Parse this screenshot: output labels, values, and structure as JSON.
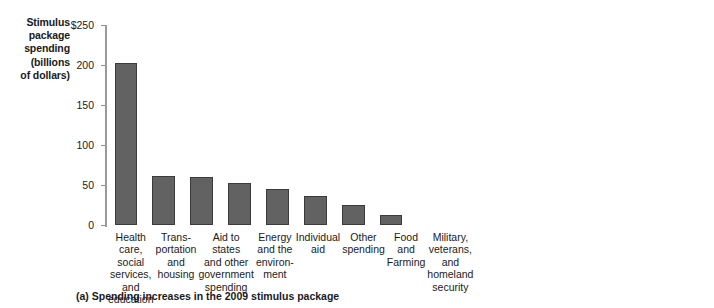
{
  "chart_data": [
    {
      "type": "bar",
      "panel": "a",
      "title": "Stimulus package spending (billions of dollars)",
      "title_lines": [
        "Stimulus",
        "package",
        "spending",
        "(billions",
        "of dollars)"
      ],
      "caption": "(a) Spending increases in the 2009 stimulus package",
      "xlabel": "",
      "ylabel": "Stimulus package spending (billions of dollars)",
      "ylim": [
        0,
        250
      ],
      "yticks": [
        0,
        50,
        100,
        150,
        200,
        250
      ],
      "ytick_labels": [
        "0",
        "50",
        "100",
        "150",
        "200",
        "$250"
      ],
      "grid": false,
      "legend": "none",
      "bar_color": "#626262",
      "categories": [
        "Health care, social services, and education",
        "Transportation and housing",
        "Aid to states and other government spending",
        "Energy and the environment",
        "Individual aid",
        "Other spending",
        "Food and Farming",
        "Military, veterans, and homeland security"
      ],
      "category_lines": [
        [
          "Health care,",
          "social services,",
          "and education"
        ],
        [
          "Trans-",
          "portation",
          "and",
          "housing"
        ],
        [
          "Aid to states",
          "and other",
          "government",
          "spending"
        ],
        [
          "Energy",
          "and the",
          "environ-",
          "ment"
        ],
        [
          "Individual",
          "aid"
        ],
        [
          "Other",
          "spending"
        ],
        [
          "Food",
          "and",
          "Farming"
        ],
        [
          "Military,",
          "veterans,",
          "and",
          "homeland",
          "security"
        ]
      ],
      "values": [
        203,
        61,
        60,
        52,
        45,
        36,
        25,
        12
      ]
    },
    {
      "type": "bar",
      "panel": "b",
      "title": "Tax Cuts (billions of dollars)",
      "title_lines": [
        "Tax Cuts",
        "(billions",
        "of dollars)"
      ],
      "caption": "(b) Tax cuts in the 2009 stimulus package",
      "xlabel": "",
      "ylabel": "Tax Cuts (billions of dollars)",
      "ylim": [
        0,
        250
      ],
      "yticks": [
        0,
        50,
        100,
        150,
        200,
        250
      ],
      "ytick_labels": [
        "0",
        "50",
        "100",
        "150",
        "200",
        "$250"
      ],
      "grid": false,
      "legend": "none",
      "bar_color": "#626262",
      "categories": [
        "Individual",
        "Infrastructure",
        "Energy",
        "Business"
      ],
      "category_lines": [
        [
          "Individual"
        ],
        [
          "Infra-",
          "structure"
        ],
        [
          "Energy"
        ],
        [
          "Business"
        ]
      ],
      "values": [
        235,
        25,
        20,
        6
      ]
    }
  ]
}
